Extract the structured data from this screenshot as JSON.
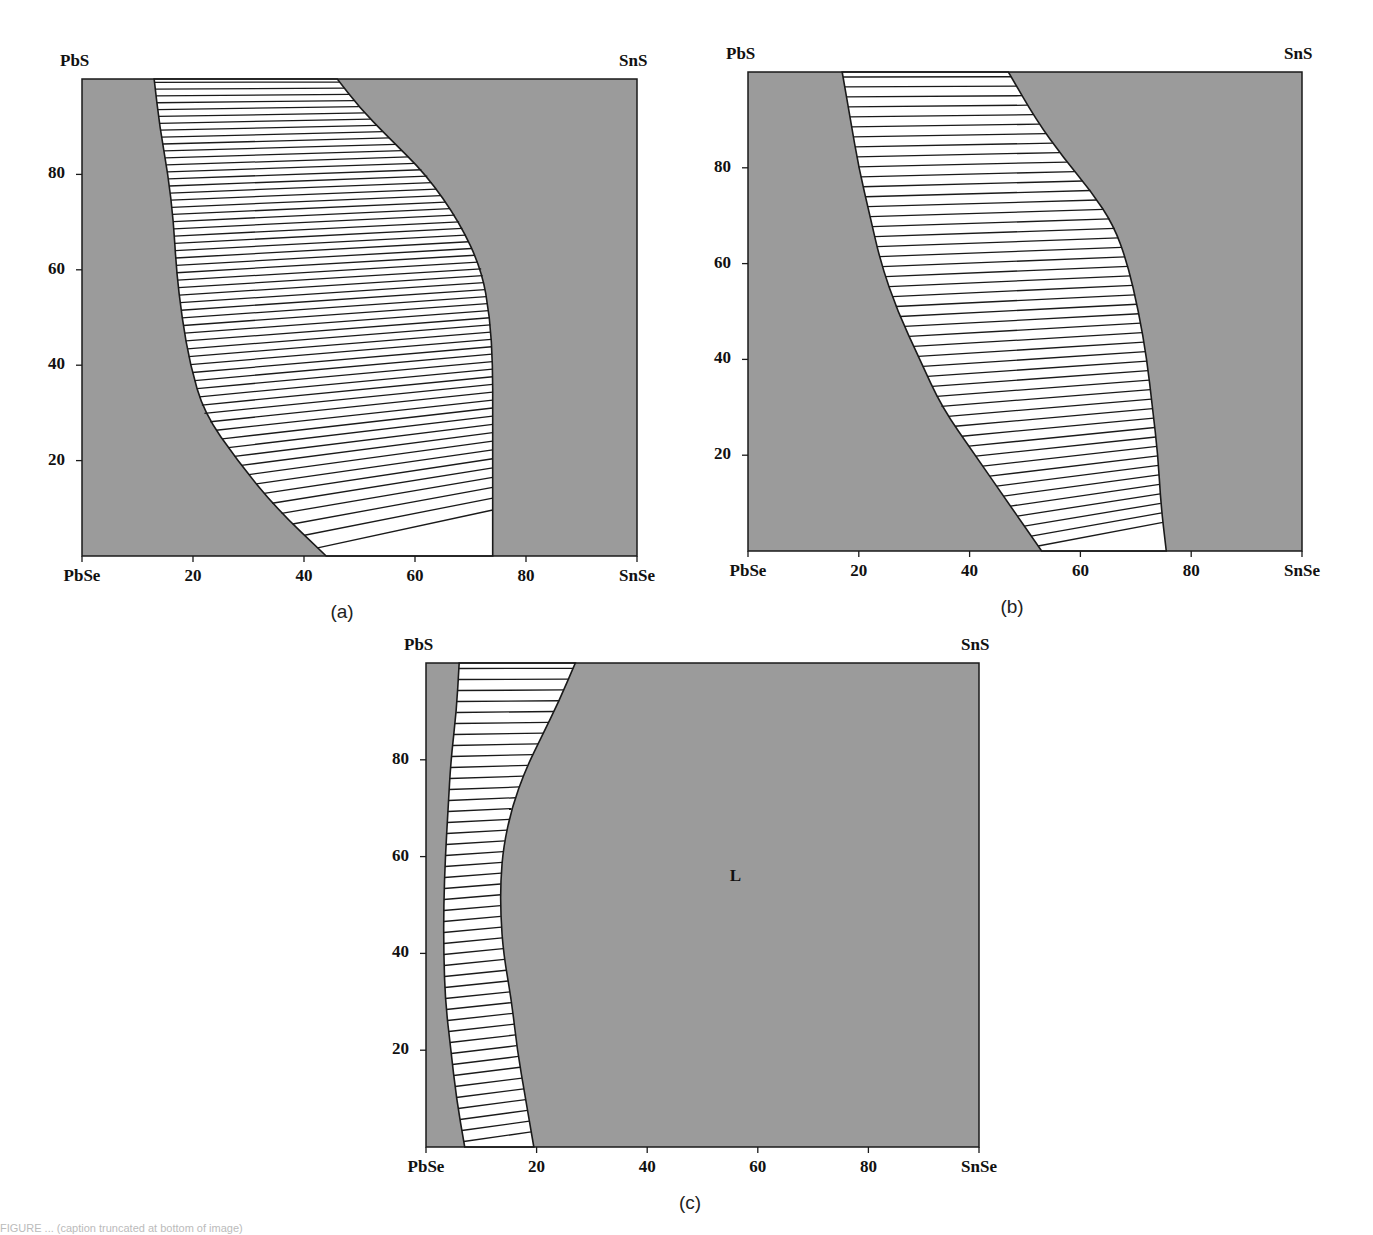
{
  "figure": {
    "caption_partial": "FIGURE ... (caption truncated at bottom of image)"
  },
  "colors": {
    "single_phase_fill": "#9b9b9b",
    "two_phase_fill": "#ffffff",
    "line": "#1a1a1a"
  },
  "chart_data": [
    {
      "type": "diagram",
      "panel": "(a)",
      "title": "",
      "corners": {
        "top_left": "PbS",
        "top_right": "SnS",
        "bottom_left": "PbSe",
        "bottom_right": "SnSe"
      },
      "xlabel": "",
      "ylabel": "",
      "xticks": [
        "PbSe",
        "20",
        "40",
        "60",
        "80",
        "SnSe"
      ],
      "yticks": [
        "20",
        "40",
        "60",
        "80"
      ],
      "xlim": [
        0,
        100
      ],
      "ylim": [
        0,
        100
      ],
      "grid": false,
      "left_boundary": [
        [
          13,
          100
        ],
        [
          14,
          90
        ],
        [
          15.5,
          80
        ],
        [
          16.5,
          70
        ],
        [
          17,
          60
        ],
        [
          18,
          50
        ],
        [
          19.5,
          40
        ],
        [
          22,
          30
        ],
        [
          28,
          20
        ],
        [
          35,
          10
        ],
        [
          44,
          0
        ]
      ],
      "right_boundary": [
        [
          46,
          100
        ],
        [
          50,
          94
        ],
        [
          55,
          88
        ],
        [
          62,
          80
        ],
        [
          68,
          70
        ],
        [
          72,
          60
        ],
        [
          73.5,
          50
        ],
        [
          74,
          40
        ],
        [
          74,
          30
        ],
        [
          74,
          20
        ],
        [
          74,
          10
        ],
        [
          74,
          0
        ]
      ],
      "tie_line_count": 60,
      "regions": [
        {
          "name": "left single-phase",
          "fill": "gray"
        },
        {
          "name": "two-phase (tie lines)",
          "fill": "white"
        },
        {
          "name": "right single-phase",
          "fill": "gray"
        }
      ],
      "caption": "(a)"
    },
    {
      "type": "diagram",
      "panel": "(b)",
      "title": "",
      "corners": {
        "top_left": "PbS",
        "top_right": "SnS",
        "bottom_left": "PbSe",
        "bottom_right": "SnSe"
      },
      "xlabel": "",
      "ylabel": "",
      "xticks": [
        "PbSe",
        "20",
        "40",
        "60",
        "80",
        "SnSe"
      ],
      "yticks": [
        "20",
        "40",
        "60",
        "80"
      ],
      "xlim": [
        0,
        100
      ],
      "ylim": [
        0,
        100
      ],
      "grid": false,
      "left_boundary": [
        [
          17,
          100
        ],
        [
          18.5,
          90
        ],
        [
          20,
          80
        ],
        [
          22,
          70
        ],
        [
          24,
          60
        ],
        [
          27,
          50
        ],
        [
          31,
          40
        ],
        [
          35,
          30
        ],
        [
          41,
          20
        ],
        [
          47,
          10
        ],
        [
          53,
          0
        ]
      ],
      "right_boundary": [
        [
          47,
          100
        ],
        [
          52,
          90
        ],
        [
          57,
          82
        ],
        [
          62,
          75
        ],
        [
          66,
          68
        ],
        [
          68.5,
          60
        ],
        [
          70.5,
          50
        ],
        [
          72,
          40
        ],
        [
          73,
          30
        ],
        [
          74,
          20
        ],
        [
          74.5,
          10
        ],
        [
          75.5,
          0
        ]
      ],
      "tie_line_count": 48,
      "regions": [
        {
          "name": "left single-phase",
          "fill": "gray"
        },
        {
          "name": "two-phase (tie lines)",
          "fill": "white"
        },
        {
          "name": "right single-phase",
          "fill": "gray"
        }
      ],
      "caption": "(b)"
    },
    {
      "type": "diagram",
      "panel": "(c)",
      "title": "",
      "corners": {
        "top_left": "PbS",
        "top_right": "SnS",
        "bottom_left": "PbSe",
        "bottom_right": "SnSe"
      },
      "xlabel": "",
      "ylabel": "",
      "xticks": [
        "PbSe",
        "20",
        "40",
        "60",
        "80",
        "SnSe"
      ],
      "yticks": [
        "20",
        "40",
        "60",
        "80"
      ],
      "xlim": [
        0,
        100
      ],
      "ylim": [
        0,
        100
      ],
      "grid": false,
      "left_boundary": [
        [
          6,
          100
        ],
        [
          5.5,
          90
        ],
        [
          4.5,
          80
        ],
        [
          4,
          70
        ],
        [
          3.5,
          60
        ],
        [
          3.2,
          50
        ],
        [
          3.2,
          40
        ],
        [
          3.5,
          30
        ],
        [
          4.5,
          20
        ],
        [
          5.5,
          10
        ],
        [
          7,
          0
        ]
      ],
      "right_boundary": [
        [
          27,
          100
        ],
        [
          24,
          92
        ],
        [
          21,
          85
        ],
        [
          18,
          78
        ],
        [
          15.5,
          70
        ],
        [
          14,
          62
        ],
        [
          13.5,
          55
        ],
        [
          13.5,
          48
        ],
        [
          14,
          40
        ],
        [
          15.5,
          30
        ],
        [
          16.5,
          20
        ],
        [
          18,
          10
        ],
        [
          19.5,
          0
        ]
      ],
      "tie_line_count": 44,
      "region_labels": [
        {
          "text": "L",
          "x": 56,
          "y": 56
        }
      ],
      "regions": [
        {
          "name": "left single-phase",
          "fill": "gray"
        },
        {
          "name": "two-phase (tie lines)",
          "fill": "white"
        },
        {
          "name": "liquid L",
          "fill": "gray"
        }
      ],
      "caption": "(c)"
    }
  ],
  "panels": [
    {
      "box": {
        "x0": 82,
        "x1": 637,
        "y0": 556,
        "y1": 79
      },
      "caption_pos": {
        "x": 342,
        "y": 601
      }
    },
    {
      "box": {
        "x0": 748,
        "x1": 1302,
        "y0": 551,
        "y1": 72
      },
      "caption_pos": {
        "x": 1012,
        "y": 596
      }
    },
    {
      "box": {
        "x0": 426,
        "x1": 979,
        "y0": 1147,
        "y1": 663
      },
      "caption_pos": {
        "x": 690,
        "y": 1192
      }
    }
  ]
}
